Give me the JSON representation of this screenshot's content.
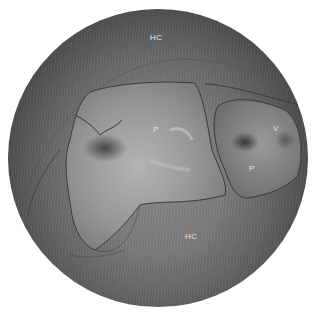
{
  "image": {
    "description": "Circular endoscopic view with outlined tissue regions",
    "labels": [
      {
        "id": "hc-top",
        "text": "HC",
        "x": 150,
        "y": 37
      },
      {
        "id": "p-center",
        "text": "P",
        "x": 153,
        "y": 129
      },
      {
        "id": "v-right",
        "text": "V",
        "x": 274,
        "y": 128
      },
      {
        "id": "p-right",
        "text": "P",
        "x": 249,
        "y": 168
      },
      {
        "id": "hc-bottom",
        "text": "HC",
        "x": 186,
        "y": 236
      }
    ],
    "colors": {
      "background": "#ffffff",
      "tissue_light": "#a8a8a8",
      "tissue_dark": "#2a2a2a",
      "outline": "#3a3a3a"
    }
  }
}
